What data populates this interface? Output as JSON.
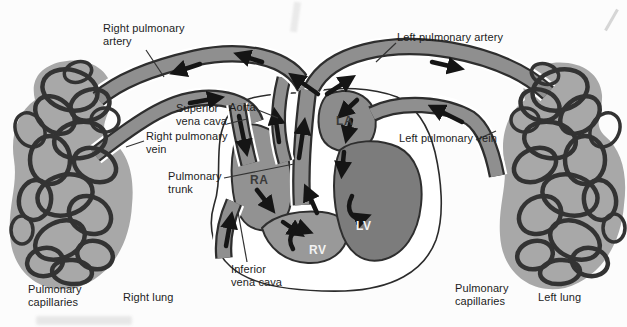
{
  "diagram": {
    "vessel_labels": {
      "right_pulmonary_artery": "Right pulmonary artery",
      "left_pulmonary_artery": "Left pulmonary artery",
      "superior_vena_cava": "Superior vena cava",
      "aorta": "Aorta",
      "right_pulmonary_vein": "Right pulmonary vein",
      "pulmonary_trunk": "Pulmonary trunk",
      "left_pulmonary_vein": "Left pulmonary vein",
      "inferior_vena_cava": "Inferior vena cava"
    },
    "heart_chambers": {
      "ra": "RA",
      "rv": "RV",
      "la": "LA",
      "lv": "LV"
    },
    "lung_labels": {
      "pulmonary_capillaries_left": "Pulmonary capillaries",
      "right_lung": "Right lung",
      "pulmonary_capillaries_right": "Pulmonary capillaries",
      "left_lung": "Left lung"
    },
    "colors": {
      "background": "#fcfcfc",
      "vessel_fill": "#8f8f8f",
      "vessel_outline": "#2e2e2e",
      "lv_fill": "#7c7c7c",
      "arrow": "#151515",
      "label_text": "#1c1c1c"
    }
  }
}
